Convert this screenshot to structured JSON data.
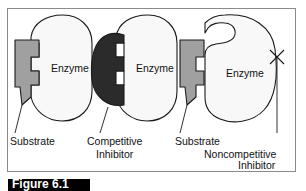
{
  "figure": {
    "caption": "Figure 6.1",
    "panel_border_color": "#8a8a8a",
    "background_color": "#ffffff"
  },
  "colors": {
    "enzyme_fill": "#f8f8f8",
    "enzyme_stroke": "#1a1a1a",
    "substrate_fill": "#a0a0a0",
    "substrate_stroke": "#1a1a1a",
    "inhibitor_fill": "#2b2b2b",
    "inhibitor_stroke": "#1a1a1a",
    "leader_line": "#1a1a1a",
    "x_mark": "#1a1a1a"
  },
  "panels": [
    {
      "id": "normal-binding",
      "enzyme_label": "Enzyme",
      "molecule_label": "Substrate",
      "molecule_kind": "substrate",
      "x_mark": false
    },
    {
      "id": "competitive-inhibition",
      "enzyme_label": "Enzyme",
      "molecule_label_line1": "Competitive",
      "molecule_label_line2": "Inhibitor",
      "molecule_kind": "competitive-inhibitor",
      "x_mark": false
    },
    {
      "id": "noncompetitive-inhibition",
      "enzyme_label": "Enzyme",
      "molecule_label": "Substrate",
      "inhibitor_label_line1": "Noncompetitive",
      "inhibitor_label_line2": "Inhibitor",
      "molecule_kind": "substrate",
      "x_mark": true
    }
  ],
  "labels": {
    "enzyme_1": "Enzyme",
    "enzyme_2": "Enzyme",
    "enzyme_3": "Enzyme",
    "substrate_1": "Substrate",
    "competitive_1": "Competitive",
    "competitive_2": "Inhibitor",
    "substrate_2": "Substrate",
    "noncompetitive_1": "Noncompetitive",
    "noncompetitive_2": "Inhibitor"
  }
}
